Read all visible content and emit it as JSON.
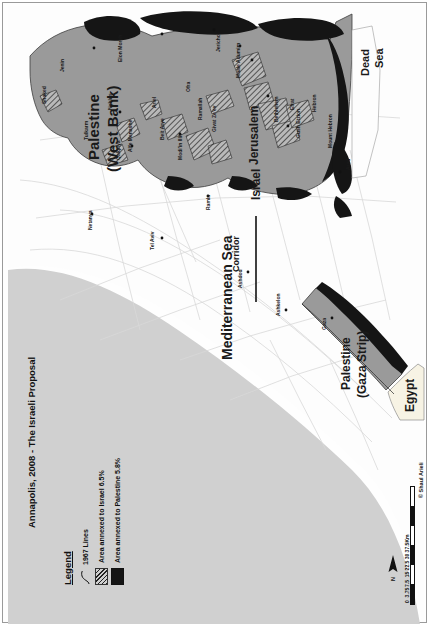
{
  "title": "Annapolis, 2008 - The Israeli Proposal",
  "legend": {
    "heading": "Legend",
    "items": [
      {
        "symbol": "line",
        "label": "1967 Lines"
      },
      {
        "symbol": "hatch",
        "label": "Area annexed to Israel 6.5%"
      },
      {
        "symbol": "solid",
        "label": "Area annexed to Palestine 5.8%"
      }
    ]
  },
  "scale": {
    "ticks": [
      "0",
      "3.75",
      "7.5",
      "15",
      "22.5",
      "30",
      "37.5"
    ],
    "unit": "Km",
    "north_label": "N"
  },
  "credit": "© Shaul Arieli",
  "colors": {
    "palestine_fill": "#9a9a9a",
    "israel_fill": "#fdfdfd",
    "sea_fill": "#d0d0d0",
    "annexed_to_palestine": "#151515",
    "egypt_fill": "#f7f3e4",
    "frame": "#9a9a9a"
  },
  "regions": [
    {
      "name": "palestine-west-bank",
      "label": "Palestine\n(West Bank)"
    },
    {
      "name": "palestine-gaza-strip",
      "label": "Palestine\n(Gaza Strip)"
    },
    {
      "name": "israel",
      "label": "Israel"
    },
    {
      "name": "egypt",
      "label": "Egypt"
    }
  ],
  "labels": {
    "west_bank_line1": "Palestine",
    "west_bank_line2": "(West Bank)",
    "gaza_line1": "Palestine",
    "gaza_line2": "(Gaza Strip)",
    "israel": "Israel",
    "egypt": "Egypt",
    "jerusalem": "Jerusalem",
    "mediterranean": "Mediterranean Sea",
    "dead_sea_l1": "Dead",
    "dead_sea_l2": "Sea",
    "corridor": "Corridor"
  },
  "places": [
    {
      "name": "Shaked"
    },
    {
      "name": "Jenin"
    },
    {
      "name": "Tulkarm"
    },
    {
      "name": "Nablus"
    },
    {
      "name": "Elon Moreh"
    },
    {
      "name": "Qalqilya"
    },
    {
      "name": "Alfe Menashe"
    },
    {
      "name": "Ariel"
    },
    {
      "name": "Modi'in Illit"
    },
    {
      "name": "Beit Arye"
    },
    {
      "name": "Ofra"
    },
    {
      "name": "Ramallah"
    },
    {
      "name": "Givat Ze'ev"
    },
    {
      "name": "Jericho"
    },
    {
      "name": "Maale Adumim"
    },
    {
      "name": "Jerusalem"
    },
    {
      "name": "Bethlehem"
    },
    {
      "name": "Efrat"
    },
    {
      "name": "Gush Etzion"
    },
    {
      "name": "Hebron"
    },
    {
      "name": "Mount Hebron"
    },
    {
      "name": "Arad"
    },
    {
      "name": "Netanya"
    },
    {
      "name": "Tel Aviv"
    },
    {
      "name": "Ramla"
    },
    {
      "name": "Ashdod"
    },
    {
      "name": "Ashkelon"
    },
    {
      "name": "Gaza"
    }
  ]
}
